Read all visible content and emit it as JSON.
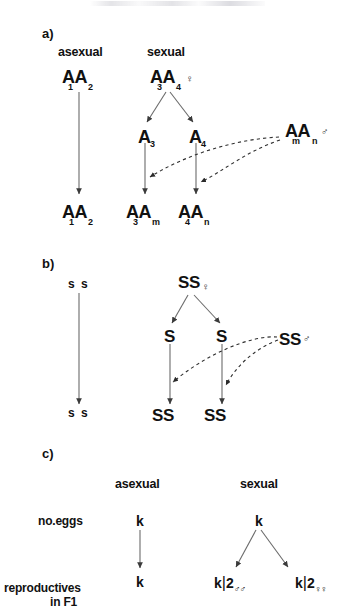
{
  "figure": {
    "caption_fragment_top": "",
    "background_color": "#ffffff",
    "ink_color": "#111111",
    "line_color": "#555555"
  },
  "panels": {
    "a": {
      "letter": "a)",
      "headings": {
        "asexual": "asexual",
        "sexual": "sexual"
      },
      "asexual": {
        "parent_base": "AA",
        "parent_sub1": "1",
        "parent_sub2": "2",
        "offspring_base": "AA",
        "offspring_sub1": "1",
        "offspring_sub2": "2"
      },
      "sexual": {
        "mother_base": "AA",
        "mother_sub1": "3",
        "mother_sub2": "4",
        "mother_symbol": "♀",
        "gamete_left": "A",
        "gamete_left_sub": "3",
        "gamete_right": "A",
        "gamete_right_sub": "4",
        "father_base": "AA",
        "father_sub1": "m",
        "father_sub2": "n",
        "father_symbol": "♂",
        "offspring_left_base": "AA",
        "offspring_left_sub1": "3",
        "offspring_left_sub2": "m",
        "offspring_right_base": "AA",
        "offspring_right_sub1": "4",
        "offspring_right_sub2": "n"
      }
    },
    "b": {
      "letter": "b)",
      "asexual": {
        "parent": "s s",
        "offspring": "s s"
      },
      "sexual": {
        "mother": "SS",
        "mother_symbol": "♀",
        "gamete_left": "S",
        "gamete_right": "S",
        "father": "SS",
        "father_symbol": "♂",
        "offspring_left": "SS",
        "offspring_right": "SS"
      }
    },
    "c": {
      "letter": "c)",
      "headings": {
        "asexual": "asexual",
        "sexual": "sexual"
      },
      "row_labels": {
        "eggs": "no.eggs",
        "reproductives_line1": "reproductives",
        "reproductives_line2": "in F1"
      },
      "asexual": {
        "eggs": "k",
        "reproductives": "k"
      },
      "sexual": {
        "eggs": "k",
        "reproductives_left_num": "k",
        "reproductives_left_bar": "|",
        "reproductives_left_den": "2",
        "reproductives_left_sexes": "♂♂",
        "reproductives_right_num": "k",
        "reproductives_right_bar": "|",
        "reproductives_right_den": "2",
        "reproductives_right_sexes": "♀♀"
      }
    }
  }
}
